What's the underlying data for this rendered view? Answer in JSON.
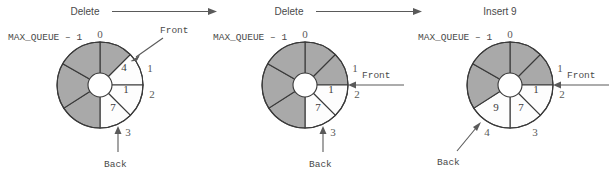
{
  "figure": {
    "colors": {
      "filled_slot": "#a9a9a9",
      "empty_slot": "#fdfdfd",
      "outline": "#3a3a3a",
      "text": "#4a4a4a",
      "background": "#ffffff"
    },
    "slot_count": 7,
    "max_label": "MAX_QUEUE – 1"
  },
  "operations": [
    {
      "id": "op-delete-1",
      "label": "Delete"
    },
    {
      "id": "op-delete-2",
      "label": "Delete"
    },
    {
      "id": "op-insert-9",
      "label": "Insert 9"
    }
  ],
  "panels": [
    {
      "id": "panel-1",
      "max_label": "MAX_QUEUE – 1",
      "front_label": "Front",
      "back_label": "Back",
      "front_pointer_style": "diagonal",
      "back_pointer_style": "vertical",
      "index_labels": [
        "0",
        "1",
        "2",
        "3"
      ],
      "values": [
        {
          "slot": "4",
          "index": "1"
        },
        {
          "slot": "1",
          "index": "2"
        },
        {
          "slot": "7",
          "index": "3"
        }
      ],
      "filled_slots": 4,
      "empty_slots": 3
    },
    {
      "id": "panel-2",
      "max_label": "MAX_QUEUE – 1",
      "front_label": "Front",
      "back_label": "Back",
      "front_pointer_style": "horizontal",
      "back_pointer_style": "vertical",
      "index_labels": [
        "0",
        "1",
        "2",
        "3"
      ],
      "values": [
        {
          "slot": "1",
          "index": "2"
        },
        {
          "slot": "7",
          "index": "3"
        }
      ],
      "filled_slots": 5,
      "empty_slots": 2
    },
    {
      "id": "panel-3",
      "max_label": "MAX_QUEUE – 1",
      "front_label": "Front",
      "back_label": "Back",
      "front_pointer_style": "horizontal",
      "back_pointer_style": "diagonal",
      "index_labels": [
        "0",
        "1",
        "2",
        "3",
        "4"
      ],
      "values": [
        {
          "slot": "1",
          "index": "2"
        },
        {
          "slot": "7",
          "index": "3"
        },
        {
          "slot": "9",
          "index": "4"
        }
      ],
      "filled_slots": 4,
      "empty_slots": 3
    }
  ]
}
